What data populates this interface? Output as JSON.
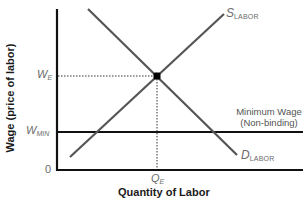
{
  "diagram": {
    "type": "labor market supply and demand with non-binding minimum wage",
    "axes": {
      "y_title": "Wage (price of labor)",
      "x_title": "Quantity of Labor",
      "origin_label": "0"
    },
    "curves": {
      "supply": {
        "label_main": "S",
        "label_sub": "LABOR"
      },
      "demand": {
        "label_main": "D",
        "label_sub": "LABOR"
      }
    },
    "levels": {
      "equilibrium_wage": {
        "label_main": "W",
        "label_sub": "E"
      },
      "minimum_wage": {
        "label_main": "W",
        "label_sub": "MIN"
      },
      "equilibrium_quantity": {
        "label_main": "Q",
        "label_sub": "E"
      }
    },
    "annotation": {
      "line1": "Minimum Wage",
      "line2": "(Non-binding)"
    },
    "colors": {
      "axis": "#111111",
      "curve": "#555555",
      "minimum_wage_line": "#111111",
      "label": "#6b6b6b"
    }
  }
}
